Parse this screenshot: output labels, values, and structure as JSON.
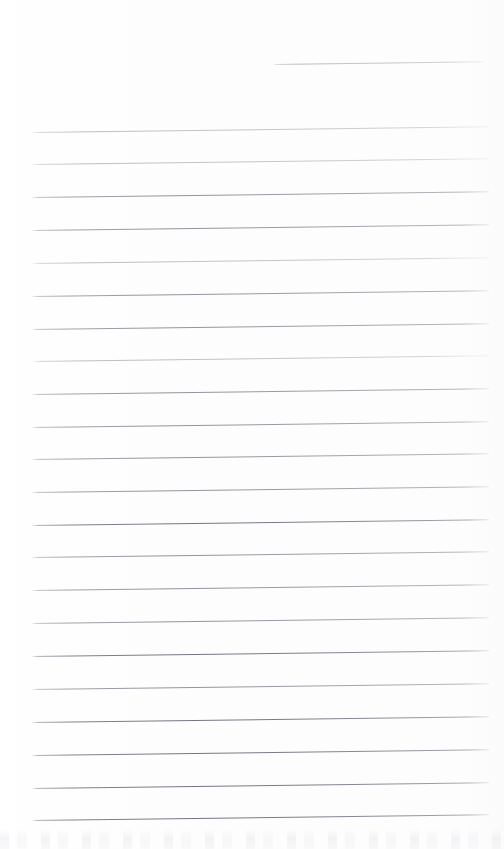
{
  "document": {
    "kind": "scanned-lined-notepad-page",
    "page_width": 504,
    "page_height": 849,
    "background_color": "#fdfdfd",
    "rule_color": "#b9b9c1",
    "rule_color_dark": "#8e8e9a",
    "content_text": "",
    "handwriting_text": "",
    "title_text": "",
    "page_number_text": ""
  },
  "ruling": {
    "line_count": 23,
    "full_line_left_x": 31,
    "full_line_right_x": 489,
    "first_full_line_y": 132,
    "last_full_line_y": 820,
    "line_spacing_px": 32.8,
    "line_thickness_px": 1,
    "skew_degrees": -0.72,
    "lines": [
      {
        "id": "rule-partial-top",
        "label": "",
        "x": 273,
        "y": 64,
        "width": 212,
        "weight": "faint"
      },
      {
        "id": "rule-01",
        "label": "",
        "x": 31,
        "y": 132,
        "width": 458,
        "weight": "faint"
      },
      {
        "id": "rule-02",
        "label": "",
        "x": 31,
        "y": 164,
        "width": 458,
        "weight": "faint"
      },
      {
        "id": "rule-03",
        "label": "",
        "x": 31,
        "y": 197,
        "width": 458,
        "weight": "normal"
      },
      {
        "id": "rule-04",
        "label": "",
        "x": 31,
        "y": 230,
        "width": 458,
        "weight": "normal"
      },
      {
        "id": "rule-05",
        "label": "",
        "x": 31,
        "y": 263,
        "width": 458,
        "weight": "faint"
      },
      {
        "id": "rule-06",
        "label": "",
        "x": 31,
        "y": 296,
        "width": 458,
        "weight": "normal"
      },
      {
        "id": "rule-07",
        "label": "",
        "x": 31,
        "y": 329,
        "width": 458,
        "weight": "normal"
      },
      {
        "id": "rule-08",
        "label": "",
        "x": 31,
        "y": 361,
        "width": 458,
        "weight": "faint"
      },
      {
        "id": "rule-09",
        "label": "",
        "x": 31,
        "y": 394,
        "width": 458,
        "weight": "normal"
      },
      {
        "id": "rule-10",
        "label": "",
        "x": 31,
        "y": 427,
        "width": 458,
        "weight": "normal"
      },
      {
        "id": "rule-11",
        "label": "",
        "x": 31,
        "y": 459,
        "width": 458,
        "weight": "normal"
      },
      {
        "id": "rule-12",
        "label": "",
        "x": 31,
        "y": 492,
        "width": 458,
        "weight": "normal"
      },
      {
        "id": "rule-13",
        "label": "",
        "x": 31,
        "y": 525,
        "width": 458,
        "weight": "strong"
      },
      {
        "id": "rule-14",
        "label": "",
        "x": 31,
        "y": 557,
        "width": 458,
        "weight": "normal"
      },
      {
        "id": "rule-15",
        "label": "",
        "x": 31,
        "y": 590,
        "width": 458,
        "weight": "normal"
      },
      {
        "id": "rule-16",
        "label": "",
        "x": 31,
        "y": 623,
        "width": 458,
        "weight": "normal"
      },
      {
        "id": "rule-17",
        "label": "",
        "x": 31,
        "y": 656,
        "width": 458,
        "weight": "strong"
      },
      {
        "id": "rule-18",
        "label": "",
        "x": 31,
        "y": 689,
        "width": 458,
        "weight": "normal"
      },
      {
        "id": "rule-19",
        "label": "",
        "x": 31,
        "y": 722,
        "width": 458,
        "weight": "strong"
      },
      {
        "id": "rule-20",
        "label": "",
        "x": 31,
        "y": 755,
        "width": 458,
        "weight": "strong"
      },
      {
        "id": "rule-21",
        "label": "",
        "x": 31,
        "y": 788,
        "width": 458,
        "weight": "strong"
      },
      {
        "id": "rule-22",
        "label": "",
        "x": 31,
        "y": 820,
        "width": 458,
        "weight": "strong"
      }
    ]
  },
  "artifacts": {
    "bleed_through": {
      "present": true,
      "y": 829,
      "height": 20,
      "description": ""
    }
  }
}
